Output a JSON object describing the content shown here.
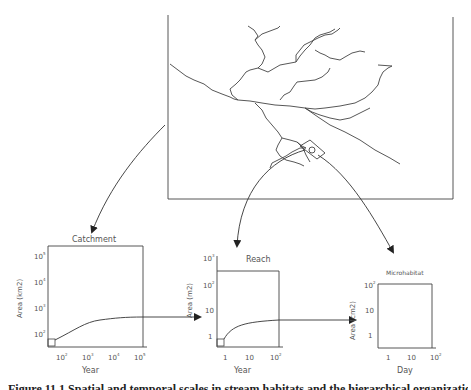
{
  "map": {
    "label": "Catchment river network map",
    "frame": {
      "x": 168,
      "y": 15,
      "w": 285,
      "h": 184
    }
  },
  "panels": [
    {
      "id": "catchment",
      "title": "Catchment",
      "ylabel": "Area (km2)",
      "xlabel": "Year",
      "yticks": [
        "10^2",
        "10^3",
        "10^4",
        "10^5"
      ],
      "xticks": [
        "10^2",
        "10^3",
        "10^4",
        "10^5"
      ]
    },
    {
      "id": "reach",
      "title": "Reach",
      "ylabel": "Area (m2)",
      "xlabel": "Year",
      "yticks": [
        "1",
        "10",
        "10^2",
        "10^3"
      ],
      "xticks": [
        "1",
        "10",
        "10^2"
      ]
    },
    {
      "id": "microhabitat",
      "title": "Microhabitat",
      "ylabel": "Area (cm2)",
      "xlabel": "Day",
      "yticks": [
        "1",
        "10",
        "10^2"
      ],
      "xticks": [
        "1",
        "10",
        "10^2"
      ]
    }
  ],
  "caption": "Figure 11.1  Spatial and temporal scales in stream habitats and the hierarchical organization"
}
